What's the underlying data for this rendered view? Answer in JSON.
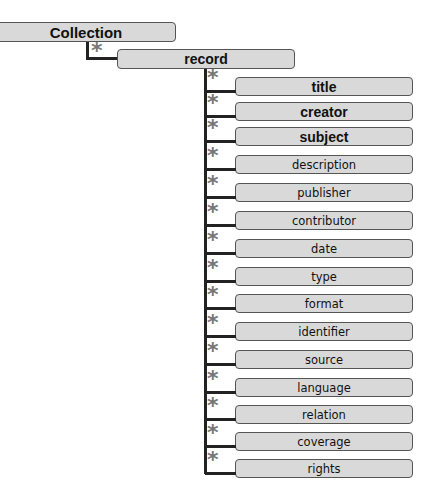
{
  "diagram": {
    "root": {
      "label": "Collection",
      "cardinality": "*"
    },
    "record": {
      "label": "record"
    },
    "elements": [
      {
        "label": "title",
        "bold": true,
        "cardinality": "*"
      },
      {
        "label": "creator",
        "bold": true,
        "cardinality": "*"
      },
      {
        "label": "subject",
        "bold": true,
        "cardinality": "*"
      },
      {
        "label": "description",
        "bold": false,
        "cardinality": "*"
      },
      {
        "label": "publisher",
        "bold": false,
        "cardinality": "*"
      },
      {
        "label": "contributor",
        "bold": false,
        "cardinality": "*"
      },
      {
        "label": "date",
        "bold": false,
        "cardinality": "*"
      },
      {
        "label": "type",
        "bold": false,
        "cardinality": "*"
      },
      {
        "label": "format",
        "bold": false,
        "cardinality": "*"
      },
      {
        "label": "identifier",
        "bold": false,
        "cardinality": "*"
      },
      {
        "label": "source",
        "bold": false,
        "cardinality": "*"
      },
      {
        "label": "language",
        "bold": false,
        "cardinality": "*"
      },
      {
        "label": "relation",
        "bold": false,
        "cardinality": "*"
      },
      {
        "label": "coverage",
        "bold": false,
        "cardinality": "*"
      },
      {
        "label": "rights",
        "bold": false,
        "cardinality": "*"
      }
    ],
    "colors": {
      "box_fill": "#d9d9d9",
      "box_border": "#555555",
      "line": "#222222",
      "star": "#777777"
    }
  }
}
